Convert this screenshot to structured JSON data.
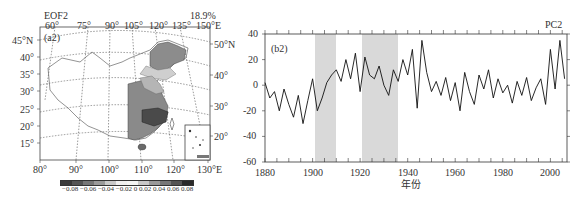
{
  "figure": {
    "left_panel": {
      "title": "EOF2",
      "variance": "18.9%",
      "panel_label": "(a2)",
      "top_lon_labels": [
        "60°",
        "75°",
        "90°",
        "105°",
        "120°",
        "135°",
        "150°E"
      ],
      "left_lat_labels": [
        "45°N",
        "40°",
        "35°",
        "30°",
        "25°",
        "20°",
        "15°"
      ],
      "right_lat_labels": [
        "50°N",
        "40°",
        "30°",
        "20°"
      ],
      "bottom_lon_labels": [
        "80°",
        "90°",
        "100°",
        "110°",
        "120°",
        "130°E"
      ],
      "colorbar": {
        "ticks": [
          "-0.08",
          "-0.06",
          "-0.04",
          "-0.02",
          "0",
          "0.02",
          "0.04",
          "0.06",
          "0.08"
        ],
        "tick_text": "−0.08 −0.06 −0.04 −0.02  0  0.02  0.04  0.06  0.08",
        "colors": [
          "#3a3a3a",
          "#555555",
          "#777777",
          "#9a9a9a",
          "#c8c8c8",
          "#efefef",
          "#f4f4f4",
          "#c8c8c8",
          "#9a9a9a",
          "#777777",
          "#555555",
          "#2a2a2a"
        ]
      }
    },
    "right_panel": {
      "series_label": "PC2",
      "panel_label": "(b2)",
      "xlabel": "年份",
      "x_ticks": [
        "1880",
        "1900",
        "1920",
        "1940",
        "1960",
        "1980",
        "2000"
      ],
      "y_ticks": [
        "40",
        "20",
        "0",
        "-20",
        "-40",
        "-60"
      ]
    }
  },
  "chart_data": [
    {
      "type": "heatmap",
      "title": "EOF2",
      "subtitle": "18.9%",
      "panel": "(a2)",
      "description": "Spatial pattern of EOF2 over China; negative loadings (gray shades) over eastern/southern China, strongest (~-0.06 to -0.08) in the middle-lower Yangtze region; weaker negative values in Northeast China",
      "colorbar_ticks": [
        -0.08,
        -0.06,
        -0.04,
        -0.02,
        0,
        0.02,
        0.04,
        0.06,
        0.08
      ],
      "lon_range": [
        80,
        130
      ],
      "lat_range": [
        15,
        50
      ]
    },
    {
      "type": "line",
      "title": "PC2",
      "panel": "(b2)",
      "xlabel": "年份",
      "ylabel": "",
      "xlim": [
        1880,
        2007
      ],
      "ylim": [
        -60,
        40
      ],
      "x_ticks": [
        1880,
        1900,
        1920,
        1940,
        1960,
        1980,
        2000
      ],
      "y_ticks": [
        -60,
        -40,
        -20,
        0,
        20,
        40
      ],
      "shaded_periods": [
        [
          1915,
          1924
        ],
        [
          1935,
          1950
        ]
      ],
      "series": [
        {
          "name": "PC2",
          "x": [
            1880,
            1882,
            1884,
            1886,
            1888,
            1890,
            1892,
            1894,
            1896,
            1898,
            1900,
            1902,
            1904,
            1906,
            1908,
            1910,
            1912,
            1914,
            1916,
            1918,
            1920,
            1922,
            1924,
            1926,
            1928,
            1930,
            1932,
            1934,
            1936,
            1938,
            1940,
            1942,
            1944,
            1946,
            1948,
            1950,
            1952,
            1954,
            1956,
            1958,
            1960,
            1962,
            1964,
            1966,
            1968,
            1970,
            1972,
            1974,
            1976,
            1978,
            1980,
            1982,
            1984,
            1986,
            1988,
            1990,
            1992,
            1994,
            1996,
            1998,
            2000,
            2002,
            2004,
            2006
          ],
          "values": [
            2,
            -10,
            -5,
            -20,
            -3,
            -15,
            -25,
            -8,
            -30,
            -12,
            5,
            -20,
            -10,
            2,
            8,
            12,
            3,
            20,
            5,
            25,
            -5,
            22,
            8,
            5,
            15,
            0,
            -8,
            12,
            3,
            20,
            8,
            28,
            -18,
            35,
            10,
            -5,
            3,
            -8,
            6,
            -12,
            2,
            -20,
            10,
            -5,
            -15,
            8,
            -3,
            12,
            -10,
            5,
            -6,
            0,
            -14,
            3,
            -8,
            6,
            -12,
            -2,
            5,
            -15,
            28,
            -3,
            35,
            5
          ]
        }
      ]
    }
  ]
}
